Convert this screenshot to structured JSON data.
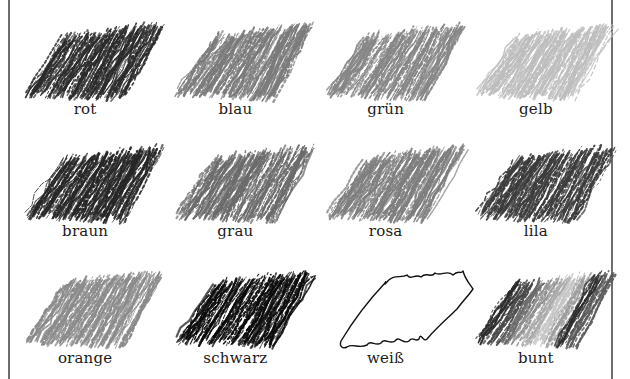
{
  "worksheet": {
    "swatch_style": "crayon-scribble-grayscale",
    "colors": [
      {
        "label": "rot",
        "tone": "#2a2a2a",
        "icon": "crayon-swatch-icon"
      },
      {
        "label": "blau",
        "tone": "#7a7a7a",
        "icon": "crayon-swatch-icon"
      },
      {
        "label": "grün",
        "tone": "#858585",
        "icon": "crayon-swatch-icon"
      },
      {
        "label": "gelb",
        "tone": "#bdbdbd",
        "icon": "crayon-swatch-icon"
      },
      {
        "label": "braun",
        "tone": "#262626",
        "icon": "crayon-swatch-icon"
      },
      {
        "label": "grau",
        "tone": "#6a6a6a",
        "icon": "crayon-swatch-icon"
      },
      {
        "label": "rosa",
        "tone": "#7d7d7d",
        "icon": "crayon-swatch-icon"
      },
      {
        "label": "lila",
        "tone": "#3c3c3c",
        "icon": "crayon-swatch-icon"
      },
      {
        "label": "orange",
        "tone": "#8a8a8a",
        "icon": "crayon-swatch-icon"
      },
      {
        "label": "schwarz",
        "tone": "#0a0a0a",
        "icon": "crayon-swatch-icon"
      },
      {
        "label": "weiß",
        "tone": "#ffffff",
        "icon": "outline-swatch-icon"
      },
      {
        "label": "bunt",
        "tone": "multi",
        "icon": "striped-swatch-icon"
      }
    ]
  }
}
